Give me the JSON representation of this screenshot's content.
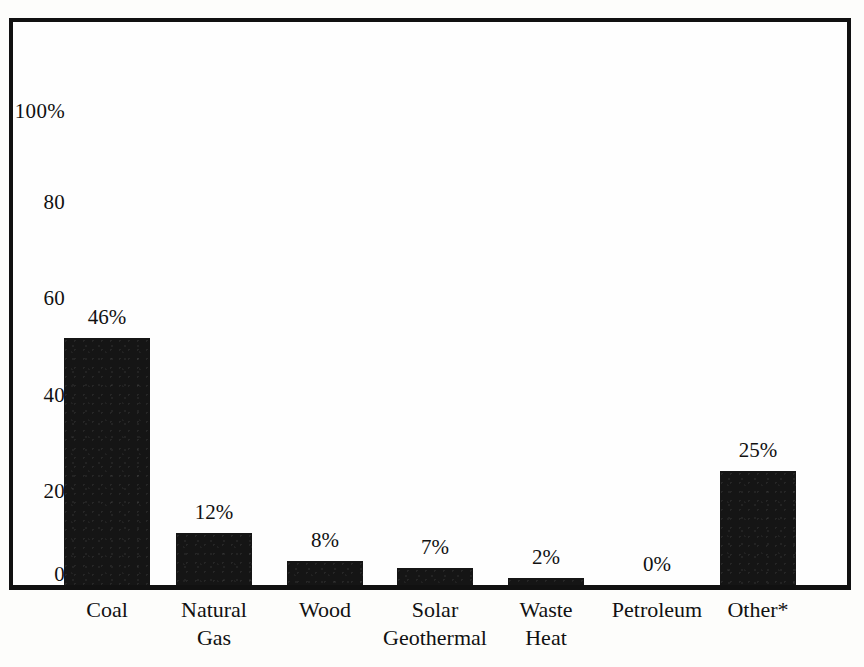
{
  "chart_data": {
    "type": "bar",
    "title": "",
    "subtitle": "",
    "xlabel": "",
    "ylabel": "",
    "ylim": [
      0,
      100
    ],
    "grid": false,
    "legend": null,
    "categories": [
      "Coal",
      "Natural Gas",
      "Wood",
      "Solar Geothermal",
      "Waste Heat",
      "Petroleum",
      "Other*"
    ],
    "category_lines": [
      [
        "Coal"
      ],
      [
        "Natural",
        "Gas"
      ],
      [
        "Wood"
      ],
      [
        "Solar",
        "Geothermal"
      ],
      [
        "Waste",
        "Heat"
      ],
      [
        "Petroleum"
      ],
      [
        "Other*"
      ]
    ],
    "values": [
      46,
      12,
      8,
      7,
      2,
      0,
      25
    ],
    "value_labels": [
      "46%",
      "12%",
      "8%",
      "7%",
      "2%",
      "0%",
      "25%"
    ],
    "drawn_heights": [
      52,
      11,
      5,
      3.5,
      1.5,
      0,
      24
    ],
    "yticks": [
      0,
      20,
      40,
      60,
      80,
      100
    ],
    "ytick_labels": [
      "0",
      "20",
      "40",
      "60",
      "80",
      "100%"
    ],
    "bar_color": "#151515",
    "frame_color": "#111111",
    "background_color": "#fefefe"
  },
  "axis": {
    "y": {
      "ticks": [
        {
          "label": "100%",
          "value": 100
        },
        {
          "label": "80",
          "value": 80
        },
        {
          "label": "60",
          "value": 60
        },
        {
          "label": "40",
          "value": 40
        },
        {
          "label": "20",
          "value": 20
        },
        {
          "label": "0",
          "value": 0
        }
      ]
    }
  },
  "bars": [
    {
      "label_line1": "Coal",
      "label_line2": "",
      "value_label": "46%"
    },
    {
      "label_line1": "Natural",
      "label_line2": "Gas",
      "value_label": "12%"
    },
    {
      "label_line1": "Wood",
      "label_line2": "",
      "value_label": "8%"
    },
    {
      "label_line1": "Solar",
      "label_line2": "Geothermal",
      "value_label": "7%"
    },
    {
      "label_line1": "Waste",
      "label_line2": "Heat",
      "value_label": "2%"
    },
    {
      "label_line1": "Petroleum",
      "label_line2": "",
      "value_label": "0%"
    },
    {
      "label_line1": "Other*",
      "label_line2": "",
      "value_label": "25%"
    }
  ]
}
